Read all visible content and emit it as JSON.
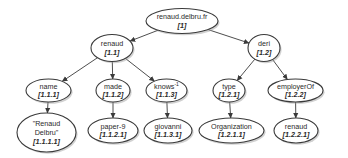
{
  "diagram": {
    "type": "tree",
    "nodes": [
      {
        "key": "root",
        "label": "renaud.delbru.fr",
        "id": "[1]",
        "cx": 182,
        "cy": 21,
        "rx": 36,
        "ry": 12.5
      },
      {
        "key": "n11",
        "label": "renaud",
        "id": "[1.1]",
        "cx": 112,
        "cy": 48,
        "rx": 21,
        "ry": 13.5
      },
      {
        "key": "n12",
        "label": "deri",
        "id": "[1.2]",
        "cx": 264,
        "cy": 48,
        "rx": 16,
        "ry": 13.5
      },
      {
        "key": "n111",
        "label": "name",
        "id": "[1.1.1]",
        "cx": 48.5,
        "cy": 90.5,
        "rx": 22.5,
        "ry": 11.5
      },
      {
        "key": "n112",
        "label": "made",
        "id": "[1.1.2]",
        "cx": 113,
        "cy": 90.5,
        "rx": 17,
        "ry": 11.5
      },
      {
        "key": "n113",
        "label": "knows",
        "sup": "-1",
        "id": "[1.1.3]",
        "cx": 166.5,
        "cy": 90.5,
        "rx": 20.5,
        "ry": 11.5
      },
      {
        "key": "n121",
        "label": "type",
        "id": "[1.2.1]",
        "cx": 229,
        "cy": 90.5,
        "rx": 16,
        "ry": 11.5
      },
      {
        "key": "n122",
        "label": "employerOf",
        "id": "[1.2.2]",
        "cx": 295.5,
        "cy": 90.5,
        "rx": 27.5,
        "ry": 11.5
      },
      {
        "key": "n1111",
        "label": "\"Renaud",
        "label2": "Delbru\"",
        "id": "[1.1.1.1]",
        "cx": 46.5,
        "cy": 132.5,
        "rx": 29.5,
        "ry": 19.5
      },
      {
        "key": "n1121",
        "label": "paper-9",
        "id": "[1.1.2.1]",
        "cx": 113,
        "cy": 130.5,
        "rx": 25,
        "ry": 12.5
      },
      {
        "key": "n1131",
        "label": "giovanni",
        "id": "[1.1.3.1]",
        "cx": 168,
        "cy": 130.5,
        "rx": 24,
        "ry": 12.5
      },
      {
        "key": "n1211",
        "label": "Organization",
        "id": "[1.2.1.1]",
        "cx": 231.5,
        "cy": 130.5,
        "rx": 32.5,
        "ry": 12.5
      },
      {
        "key": "n1221",
        "label": "renaud",
        "id": "[1.2.2.1]",
        "cx": 296,
        "cy": 130.5,
        "rx": 22,
        "ry": 12.5
      }
    ],
    "edges": [
      {
        "from": "root",
        "to": "n11"
      },
      {
        "from": "root",
        "to": "n12"
      },
      {
        "from": "n11",
        "to": "n111"
      },
      {
        "from": "n11",
        "to": "n112"
      },
      {
        "from": "n11",
        "to": "n113"
      },
      {
        "from": "n12",
        "to": "n121"
      },
      {
        "from": "n12",
        "to": "n122"
      },
      {
        "from": "n111",
        "to": "n1111"
      },
      {
        "from": "n112",
        "to": "n1121"
      },
      {
        "from": "n113",
        "to": "n1131"
      },
      {
        "from": "n121",
        "to": "n1211"
      },
      {
        "from": "n122",
        "to": "n1221"
      }
    ],
    "colors": {
      "stroke": "#3a3a3a",
      "fill": "#ffffff",
      "text": "#2a2a2a",
      "shadow": "#9a9a9a"
    }
  }
}
